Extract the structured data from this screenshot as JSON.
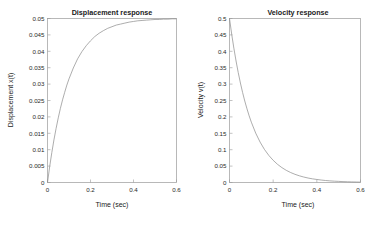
{
  "figure": {
    "background": "#ffffff",
    "curve_color": "#8a8a8a",
    "axis_color": "#9a9a9a",
    "text_color": "#1a1a1a"
  },
  "chart_data": [
    {
      "type": "line",
      "name": "displacement-response",
      "title": "Displacement response",
      "xlabel": "Time (sec)",
      "ylabel": "Displacement x(t)",
      "xlim": [
        0,
        0.6
      ],
      "ylim": [
        0,
        0.05
      ],
      "grid": false,
      "legend": null,
      "xticks": [
        0,
        0.2,
        0.4,
        0.6
      ],
      "xticklabels": [
        "0",
        "0.2",
        "0.4",
        "0.6"
      ],
      "yticks": [
        0,
        0.005,
        0.01,
        0.015,
        0.02,
        0.025,
        0.03,
        0.035,
        0.04,
        0.045,
        0.05
      ],
      "yticklabels": [
        "0",
        "0.005",
        "0.01",
        "0.015",
        "0.02",
        "0.025",
        "0.03",
        "0.035",
        "0.04",
        "0.045",
        "0.05"
      ],
      "series": [
        {
          "name": "x(t)",
          "x": [
            0,
            0.01,
            0.02,
            0.03,
            0.04,
            0.05,
            0.06,
            0.07,
            0.08,
            0.09,
            0.1,
            0.12,
            0.14,
            0.16,
            0.18,
            0.2,
            0.22,
            0.24,
            0.26,
            0.28,
            0.3,
            0.32,
            0.34,
            0.36,
            0.38,
            0.4,
            0.42,
            0.44,
            0.46,
            0.48,
            0.5,
            0.52,
            0.54,
            0.56,
            0.58,
            0.6
          ],
          "y": [
            0.0,
            0.0048,
            0.0091,
            0.013,
            0.0165,
            0.0197,
            0.0226,
            0.0252,
            0.0275,
            0.0297,
            0.0316,
            0.0349,
            0.0377,
            0.0399,
            0.0417,
            0.0432,
            0.0445,
            0.0455,
            0.0463,
            0.047,
            0.0475,
            0.048,
            0.0483,
            0.0486,
            0.0489,
            0.0491,
            0.0493,
            0.0494,
            0.0495,
            0.0496,
            0.0497,
            0.0497,
            0.0498,
            0.0498,
            0.0499,
            0.0499
          ]
        }
      ]
    },
    {
      "type": "line",
      "name": "velocity-response",
      "title": "Velocity response",
      "xlabel": "Time (sec)",
      "ylabel": "Velocity v(t)",
      "xlim": [
        0,
        0.6
      ],
      "ylim": [
        0,
        0.5
      ],
      "grid": false,
      "legend": null,
      "xticks": [
        0,
        0.2,
        0.4,
        0.6
      ],
      "xticklabels": [
        "0",
        "0.2",
        "0.4",
        "0.6"
      ],
      "yticks": [
        0,
        0.05,
        0.1,
        0.15,
        0.2,
        0.25,
        0.3,
        0.35,
        0.4,
        0.45,
        0.5
      ],
      "yticklabels": [
        "0",
        "0.05",
        "0.1",
        "0.15",
        "0.2",
        "0.25",
        "0.3",
        "0.35",
        "0.4",
        "0.45",
        "0.5"
      ],
      "series": [
        {
          "name": "v(t)",
          "x": [
            0,
            0.01,
            0.02,
            0.03,
            0.04,
            0.05,
            0.06,
            0.07,
            0.08,
            0.09,
            0.1,
            0.12,
            0.14,
            0.16,
            0.18,
            0.2,
            0.22,
            0.24,
            0.26,
            0.28,
            0.3,
            0.32,
            0.34,
            0.36,
            0.38,
            0.4,
            0.42,
            0.44,
            0.46,
            0.48,
            0.5,
            0.52,
            0.54,
            0.56,
            0.58,
            0.6
          ],
          "y": [
            0.5,
            0.4524,
            0.4094,
            0.3704,
            0.3352,
            0.3033,
            0.2744,
            0.2483,
            0.2247,
            0.2033,
            0.1839,
            0.1506,
            0.1233,
            0.1009,
            0.0826,
            0.0677,
            0.0554,
            0.0454,
            0.0371,
            0.0304,
            0.0249,
            0.0204,
            0.0167,
            0.0136,
            0.0112,
            0.0092,
            0.0075,
            0.0061,
            0.005,
            0.0041,
            0.0034,
            0.0027,
            0.0022,
            0.0018,
            0.0015,
            0.0012
          ]
        }
      ]
    }
  ]
}
